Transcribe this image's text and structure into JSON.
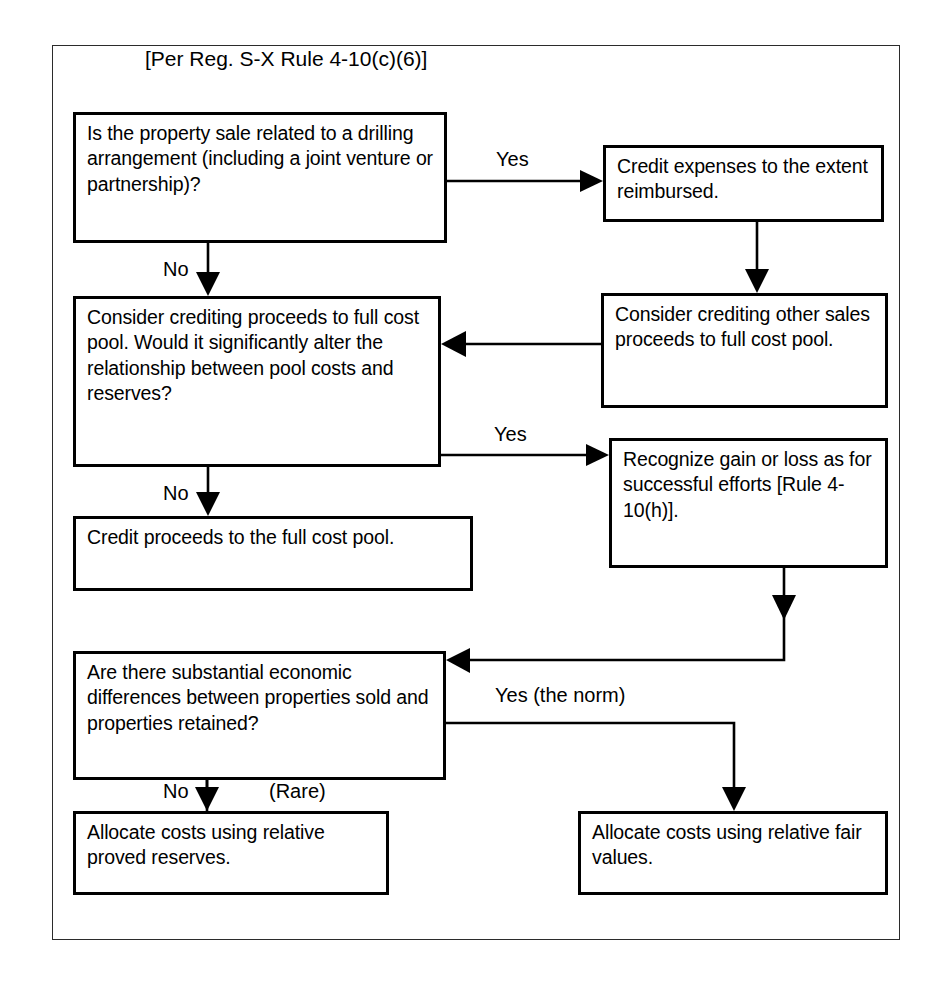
{
  "diagram": {
    "title": "[Per Reg. S-X Rule 4-10(c)(6)]",
    "type": "flowchart",
    "nodes": [
      {
        "id": "n1",
        "kind": "decision",
        "text": "Is the property sale related to a drilling arrangement (including a joint venture or partnership)?"
      },
      {
        "id": "n2",
        "kind": "process",
        "text": "Credit expenses to the extent reimbursed."
      },
      {
        "id": "n3",
        "kind": "process",
        "text": "Consider crediting other sales proceeds to full cost pool."
      },
      {
        "id": "n4",
        "kind": "decision",
        "text": "Consider crediting proceeds to full cost pool.  Would it significantly alter the relationship between pool costs and reserves?"
      },
      {
        "id": "n5",
        "kind": "process",
        "text": "Recognize gain or loss as for successful efforts [Rule 4-10(h)]."
      },
      {
        "id": "n6",
        "kind": "process",
        "text": "Credit proceeds to the full cost pool."
      },
      {
        "id": "n7",
        "kind": "decision",
        "text": "Are there substantial economic differences between properties sold and properties retained?"
      },
      {
        "id": "n8",
        "kind": "process",
        "text": "Allocate costs using relative proved reserves."
      },
      {
        "id": "n9",
        "kind": "process",
        "text": "Allocate costs using relative fair values."
      }
    ],
    "edges": [
      {
        "id": "e1",
        "from": "n1",
        "to": "n2",
        "label": "Yes"
      },
      {
        "id": "e2",
        "from": "n1",
        "to": "n4",
        "label": "No"
      },
      {
        "id": "e3",
        "from": "n2",
        "to": "n3",
        "label": ""
      },
      {
        "id": "e4",
        "from": "n3",
        "to": "n4",
        "label": ""
      },
      {
        "id": "e5",
        "from": "n4",
        "to": "n5",
        "label": "Yes"
      },
      {
        "id": "e6",
        "from": "n4",
        "to": "n6",
        "label": "No"
      },
      {
        "id": "e7",
        "from": "n5",
        "to": "n7",
        "label": ""
      },
      {
        "id": "e8",
        "from": "n7",
        "to": "n8",
        "label": "No"
      },
      {
        "id": "e9",
        "from": "n7",
        "to": "n8",
        "label": "(Rare)"
      },
      {
        "id": "e10",
        "from": "n7",
        "to": "n9",
        "label": "Yes (the norm)"
      }
    ],
    "labels": {
      "yes_top": "Yes",
      "no_top": "No",
      "yes_mid": "Yes",
      "no_mid": "No",
      "no_bottom": "No",
      "rare": "(Rare)",
      "yes_norm": "Yes (the norm)"
    },
    "colors": {
      "stroke": "#000000",
      "background": "#ffffff",
      "frame": "#2b2b2b"
    }
  }
}
